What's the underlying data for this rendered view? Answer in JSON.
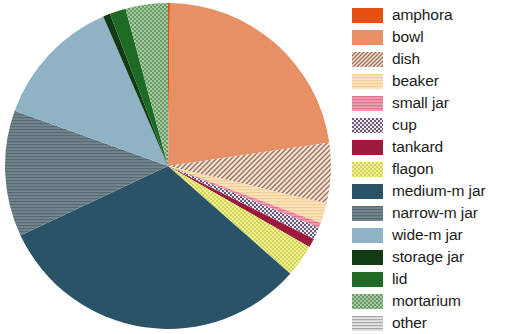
{
  "chart_data": {
    "type": "pie",
    "title": "",
    "subtitle": "",
    "xlabel": "",
    "ylabel": "",
    "legend_position": "right",
    "grid": false,
    "start_angle_deg": 0,
    "direction": "clockwise",
    "categories": [
      "amphora",
      "bowl",
      "dish",
      "beaker",
      "small jar",
      "cup",
      "tankard",
      "flagon",
      "medium-m jar",
      "narrow-m jar",
      "wide-m jar",
      "storage jar",
      "lid",
      "mortarium",
      "other"
    ],
    "values": [
      0.2,
      22.5,
      6.0,
      2.0,
      0.5,
      1.2,
      0.9,
      3.2,
      31.5,
      12.5,
      13.0,
      0.7,
      1.6,
      4.2,
      0.0
    ],
    "slices": [
      {
        "label": "amphora",
        "value": 0.2,
        "color": "#e8500f",
        "pattern": "solid",
        "pattern_color": "#c43f08",
        "start_deg": 0.0,
        "end_deg": 0.7
      },
      {
        "label": "bowl",
        "value": 22.5,
        "color": "#e79066",
        "pattern": "solid",
        "pattern_color": "#d2764c",
        "start_deg": 0.7,
        "end_deg": 81.7
      },
      {
        "label": "dish",
        "value": 6.0,
        "color": "#f2e2d6",
        "pattern": "diagonal",
        "pattern_color": "#9a7258",
        "start_deg": 81.7,
        "end_deg": 103.3
      },
      {
        "label": "beaker",
        "value": 2.0,
        "color": "#fbe2b8",
        "pattern": "horizontal",
        "pattern_color": "#f0cf9a",
        "start_deg": 103.3,
        "end_deg": 110.5
      },
      {
        "label": "small jar",
        "value": 0.5,
        "color": "#f79ab0",
        "pattern": "horizontal",
        "pattern_color": "#e2758e",
        "start_deg": 110.5,
        "end_deg": 112.3
      },
      {
        "label": "cup",
        "value": 1.2,
        "color": "#ece6ee",
        "pattern": "checker",
        "pattern_color": "#6b5a78",
        "start_deg": 112.3,
        "end_deg": 116.6
      },
      {
        "label": "tankard",
        "value": 0.9,
        "color": "#9c1b3c",
        "pattern": "solid",
        "pattern_color": "#7d1330",
        "start_deg": 116.6,
        "end_deg": 119.8
      },
      {
        "label": "flagon",
        "value": 3.2,
        "color": "#eff08a",
        "pattern": "dots",
        "pattern_color": "#c9cc52",
        "start_deg": 119.8,
        "end_deg": 131.4
      },
      {
        "label": "medium-m jar",
        "value": 31.5,
        "color": "#2b5368",
        "pattern": "solid",
        "pattern_color": "#24485b",
        "start_deg": 131.4,
        "end_deg": 244.8
      },
      {
        "label": "narrow-m jar",
        "value": 12.5,
        "color": "#72868f",
        "pattern": "horizontal",
        "pattern_color": "#58696f",
        "start_deg": 244.8,
        "end_deg": 289.8
      },
      {
        "label": "wide-m jar",
        "value": 13.0,
        "color": "#8fb2c4",
        "pattern": "solid",
        "pattern_color": "#7ba1b5",
        "start_deg": 289.8,
        "end_deg": 336.6
      },
      {
        "label": "storage jar",
        "value": 0.7,
        "color": "#123a15",
        "pattern": "solid",
        "pattern_color": "#0c2c10",
        "start_deg": 336.6,
        "end_deg": 339.1
      },
      {
        "label": "lid",
        "value": 1.6,
        "color": "#1d6b25",
        "pattern": "solid",
        "pattern_color": "#155019",
        "start_deg": 339.1,
        "end_deg": 344.9
      },
      {
        "label": "mortarium",
        "value": 4.2,
        "color": "#a9cba3",
        "pattern": "dots",
        "pattern_color": "#4f8a52",
        "start_deg": 344.9,
        "end_deg": 360.0
      },
      {
        "label": "other",
        "value": 0.0,
        "color": "#e3e3e3",
        "pattern": "horizontal",
        "pattern_color": "#a8a8a8",
        "start_deg": 360.0,
        "end_deg": 360.0
      }
    ]
  },
  "legend": {
    "items": [
      {
        "label": "amphora",
        "color": "#e8500f",
        "pattern": "solid",
        "pattern_color": "#c43f08"
      },
      {
        "label": "bowl",
        "color": "#e79066",
        "pattern": "solid",
        "pattern_color": "#d2764c"
      },
      {
        "label": "dish",
        "color": "#f2e2d6",
        "pattern": "diagonal",
        "pattern_color": "#9a7258"
      },
      {
        "label": "beaker",
        "color": "#fbe2b8",
        "pattern": "horizontal",
        "pattern_color": "#f0cf9a"
      },
      {
        "label": "small jar",
        "color": "#f79ab0",
        "pattern": "horizontal",
        "pattern_color": "#e2758e"
      },
      {
        "label": "cup",
        "color": "#ece6ee",
        "pattern": "checker",
        "pattern_color": "#6b5a78"
      },
      {
        "label": "tankard",
        "color": "#9c1b3c",
        "pattern": "solid",
        "pattern_color": "#7d1330"
      },
      {
        "label": "flagon",
        "color": "#eff08a",
        "pattern": "dots",
        "pattern_color": "#c9cc52"
      },
      {
        "label": "medium-m jar",
        "color": "#2b5368",
        "pattern": "solid",
        "pattern_color": "#24485b"
      },
      {
        "label": "narrow-m jar",
        "color": "#72868f",
        "pattern": "horizontal",
        "pattern_color": "#58696f"
      },
      {
        "label": "wide-m jar",
        "color": "#8fb2c4",
        "pattern": "solid",
        "pattern_color": "#7ba1b5"
      },
      {
        "label": "storage jar",
        "color": "#123a15",
        "pattern": "solid",
        "pattern_color": "#0c2c10"
      },
      {
        "label": "lid",
        "color": "#1d6b25",
        "pattern": "solid",
        "pattern_color": "#155019"
      },
      {
        "label": "mortarium",
        "color": "#a9cba3",
        "pattern": "dots",
        "pattern_color": "#4f8a52"
      },
      {
        "label": "other",
        "color": "#e3e3e3",
        "pattern": "horizontal",
        "pattern_color": "#a8a8a8"
      }
    ]
  },
  "geometry": {
    "center_x": 168,
    "center_y": 166,
    "radius": 163
  }
}
